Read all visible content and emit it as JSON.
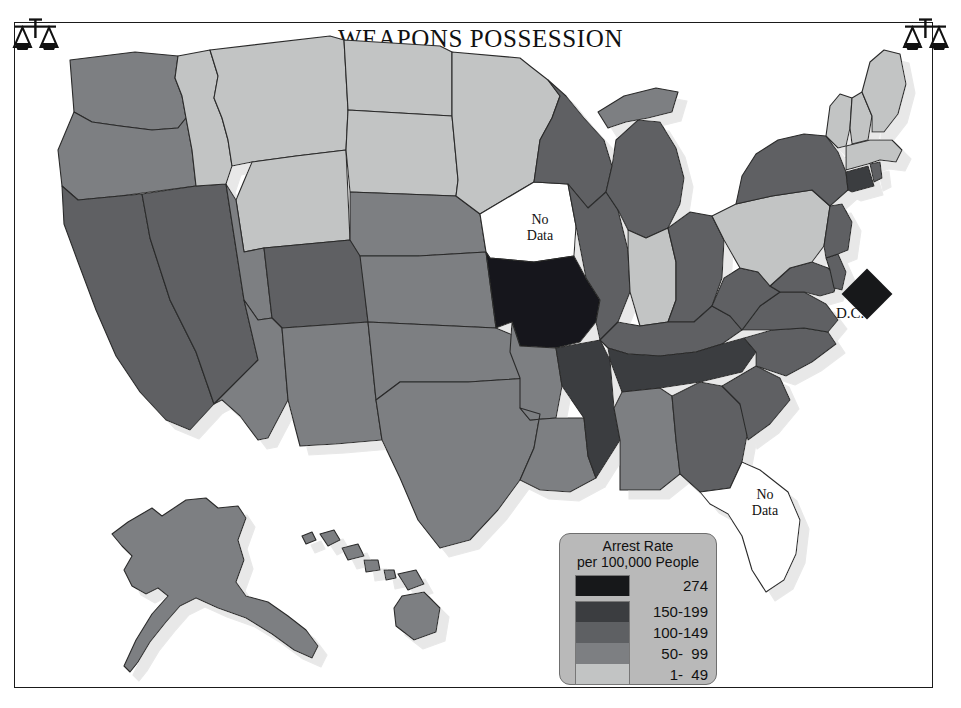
{
  "title": {
    "main": "WEAPONS POSSESSION",
    "year": "1991"
  },
  "icons": {
    "left": "scales-of-justice-icon",
    "right": "scales-of-justice-icon"
  },
  "legend": {
    "title_line1": "Arrest Rate",
    "title_line2": "per 100,000 People",
    "panel_color": "#b9b9b9",
    "rows": [
      {
        "label": "274",
        "color": "#17181a"
      },
      {
        "label": "150-199",
        "color": "#3b3d40"
      },
      {
        "label": "100-149",
        "color": "#5e6063"
      },
      {
        "label": "50-  99",
        "color": "#7d7f82"
      },
      {
        "label": "1-  49",
        "color": "#c2c4c4"
      }
    ]
  },
  "map_labels": {
    "iowa": "No\nData",
    "florida": "No\nData",
    "dc": "D.C."
  },
  "chart_data": {
    "type": "map",
    "title": "WEAPONS POSSESSION 1991",
    "subtitle": "Arrest Rate per 100,000 People",
    "legend_position": "bottom-right",
    "bins": [
      {
        "label": "274",
        "min": 274,
        "max": 274,
        "color": "#17181a"
      },
      {
        "label": "150-199",
        "min": 150,
        "max": 199,
        "color": "#3b3d40"
      },
      {
        "label": "100-149",
        "min": 100,
        "max": 149,
        "color": "#5e6063"
      },
      {
        "label": "50-  99",
        "min": 50,
        "max": 99,
        "color": "#7d7f82"
      },
      {
        "label": "1-  49",
        "min": 1,
        "max": 49,
        "color": "#c2c4c4"
      }
    ],
    "no_data_color": "#ffffff",
    "regions": [
      {
        "code": "WA",
        "name": "Washington",
        "bin": "50-  99"
      },
      {
        "code": "OR",
        "name": "Oregon",
        "bin": "50-  99"
      },
      {
        "code": "CA",
        "name": "California",
        "bin": "100-149"
      },
      {
        "code": "NV",
        "name": "Nevada",
        "bin": "100-149"
      },
      {
        "code": "ID",
        "name": "Idaho",
        "bin": "1-  49"
      },
      {
        "code": "MT",
        "name": "Montana",
        "bin": "1-  49"
      },
      {
        "code": "WY",
        "name": "Wyoming",
        "bin": "1-  49"
      },
      {
        "code": "UT",
        "name": "Utah",
        "bin": "50-  99"
      },
      {
        "code": "AZ",
        "name": "Arizona",
        "bin": "50-  99"
      },
      {
        "code": "CO",
        "name": "Colorado",
        "bin": "100-149"
      },
      {
        "code": "NM",
        "name": "New Mexico",
        "bin": "50-  99"
      },
      {
        "code": "ND",
        "name": "North Dakota",
        "bin": "1-  49"
      },
      {
        "code": "SD",
        "name": "South Dakota",
        "bin": "1-  49"
      },
      {
        "code": "NE",
        "name": "Nebraska",
        "bin": "50-  99"
      },
      {
        "code": "KS",
        "name": "Kansas",
        "bin": "50-  99"
      },
      {
        "code": "OK",
        "name": "Oklahoma",
        "bin": "50-  99"
      },
      {
        "code": "TX",
        "name": "Texas",
        "bin": "50-  99"
      },
      {
        "code": "MN",
        "name": "Minnesota",
        "bin": "1-  49"
      },
      {
        "code": "IA",
        "name": "Iowa",
        "bin": "no data"
      },
      {
        "code": "MO",
        "name": "Missouri",
        "bin": "274"
      },
      {
        "code": "AR",
        "name": "Arkansas",
        "bin": "50-  99"
      },
      {
        "code": "LA",
        "name": "Louisiana",
        "bin": "50-  99"
      },
      {
        "code": "WI",
        "name": "Wisconsin",
        "bin": "100-149"
      },
      {
        "code": "IL",
        "name": "Illinois",
        "bin": "100-149"
      },
      {
        "code": "MS",
        "name": "Mississippi",
        "bin": "150-199"
      },
      {
        "code": "MI",
        "name": "Michigan",
        "bin": "100-149"
      },
      {
        "code": "IN",
        "name": "Indiana",
        "bin": "1-  49"
      },
      {
        "code": "OH",
        "name": "Ohio",
        "bin": "100-149"
      },
      {
        "code": "KY",
        "name": "Kentucky",
        "bin": "100-149"
      },
      {
        "code": "TN",
        "name": "Tennessee",
        "bin": "150-199"
      },
      {
        "code": "AL",
        "name": "Alabama",
        "bin": "50-  99"
      },
      {
        "code": "GA",
        "name": "Georgia",
        "bin": "100-149"
      },
      {
        "code": "FL",
        "name": "Florida",
        "bin": "no data"
      },
      {
        "code": "SC",
        "name": "South Carolina",
        "bin": "100-149"
      },
      {
        "code": "NC",
        "name": "North Carolina",
        "bin": "100-149"
      },
      {
        "code": "VA",
        "name": "Virginia",
        "bin": "100-149"
      },
      {
        "code": "WV",
        "name": "West Virginia",
        "bin": "100-149"
      },
      {
        "code": "MD",
        "name": "Maryland",
        "bin": "100-149"
      },
      {
        "code": "DE",
        "name": "Delaware",
        "bin": "100-149"
      },
      {
        "code": "PA",
        "name": "Pennsylvania",
        "bin": "1-  49"
      },
      {
        "code": "NJ",
        "name": "New Jersey",
        "bin": "100-149"
      },
      {
        "code": "NY",
        "name": "New York",
        "bin": "100-149"
      },
      {
        "code": "CT",
        "name": "Connecticut",
        "bin": "150-199"
      },
      {
        "code": "RI",
        "name": "Rhode Island",
        "bin": "100-149"
      },
      {
        "code": "MA",
        "name": "Massachusetts",
        "bin": "1-  49"
      },
      {
        "code": "VT",
        "name": "Vermont",
        "bin": "1-  49"
      },
      {
        "code": "NH",
        "name": "New Hampshire",
        "bin": "1-  49"
      },
      {
        "code": "ME",
        "name": "Maine",
        "bin": "1-  49"
      },
      {
        "code": "AK",
        "name": "Alaska",
        "bin": "50-  99"
      },
      {
        "code": "HI",
        "name": "Hawaii",
        "bin": "50-  99"
      },
      {
        "code": "DC",
        "name": "District of Columbia",
        "bin": "274"
      }
    ]
  }
}
